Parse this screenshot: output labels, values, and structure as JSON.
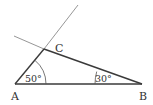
{
  "diagram": {
    "type": "triangle-geometry",
    "points": {
      "A": {
        "label": "A",
        "x": 15,
        "y": 84
      },
      "B": {
        "label": "B",
        "x": 142,
        "y": 84
      },
      "C": {
        "label": "C",
        "x": 44,
        "y": 49
      }
    },
    "angles": {
      "A": {
        "label": "50°"
      },
      "B": {
        "label": "30°"
      }
    },
    "colors": {
      "side": "#3a3a3a",
      "extension": "#8a8a8a",
      "text": "#333333"
    }
  }
}
